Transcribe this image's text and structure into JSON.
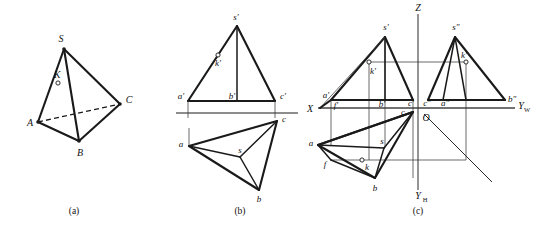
{
  "figure": {
    "background_color": "#ffffff",
    "line_color": "#1a1a1a",
    "thin_line_color": "#3a3a3a",
    "ground_line_color": "#8d8d8d"
  },
  "panels": [
    {
      "id": "a",
      "caption": "(a)",
      "description": "Pictorial view of tetrahedron",
      "labels": [
        {
          "name": "S",
          "text": "S"
        },
        {
          "name": "A",
          "text": "A"
        },
        {
          "name": "B",
          "text": "B"
        },
        {
          "name": "C",
          "text": "C"
        },
        {
          "name": "K",
          "text": "K"
        }
      ]
    },
    {
      "id": "b",
      "caption": "(b)",
      "description": "Two-view projection: front view above ground line, top view below",
      "labels": [
        {
          "name": "s-prime",
          "text": "s′"
        },
        {
          "name": "k-prime",
          "text": "k′"
        },
        {
          "name": "a-prime",
          "text": "a′"
        },
        {
          "name": "b-prime",
          "text": "b′"
        },
        {
          "name": "c-prime",
          "text": "c′"
        },
        {
          "name": "a",
          "text": "a"
        },
        {
          "name": "b",
          "text": "b"
        },
        {
          "name": "c",
          "text": "c"
        },
        {
          "name": "s",
          "text": "s"
        }
      ]
    },
    {
      "id": "c",
      "caption": "(c)",
      "description": "Three-view projection with Z, YW, YH axes and origin O",
      "axes": [
        {
          "name": "axis-Z",
          "text": "Z"
        },
        {
          "name": "axis-X",
          "text": "X"
        },
        {
          "name": "axis-YW",
          "text": "Y",
          "subscript": "W"
        },
        {
          "name": "axis-YH",
          "text": "Y",
          "subscript": "H"
        },
        {
          "name": "origin-O",
          "text": "O"
        }
      ],
      "labels": [
        {
          "name": "s-prime",
          "text": "s′"
        },
        {
          "name": "k-prime",
          "text": "k′"
        },
        {
          "name": "a-prime",
          "text": "a′"
        },
        {
          "name": "b-prime",
          "text": "b′"
        },
        {
          "name": "c-prime",
          "text": "c′"
        },
        {
          "name": "f-prime",
          "text": "f′"
        },
        {
          "name": "s-dprime",
          "text": "s″"
        },
        {
          "name": "k-dprime",
          "text": "k′"
        },
        {
          "name": "a-dprime",
          "text": "a″"
        },
        {
          "name": "b-dprime",
          "text": "b″"
        },
        {
          "name": "c-dprime",
          "text": "c″"
        },
        {
          "name": "a",
          "text": "a"
        },
        {
          "name": "b",
          "text": "b"
        },
        {
          "name": "c",
          "text": "c"
        },
        {
          "name": "s",
          "text": "s"
        },
        {
          "name": "k",
          "text": "k"
        },
        {
          "name": "f",
          "text": "f"
        }
      ]
    }
  ],
  "captions": {
    "a": "(a)",
    "b": "(b)",
    "c": "(c)"
  }
}
